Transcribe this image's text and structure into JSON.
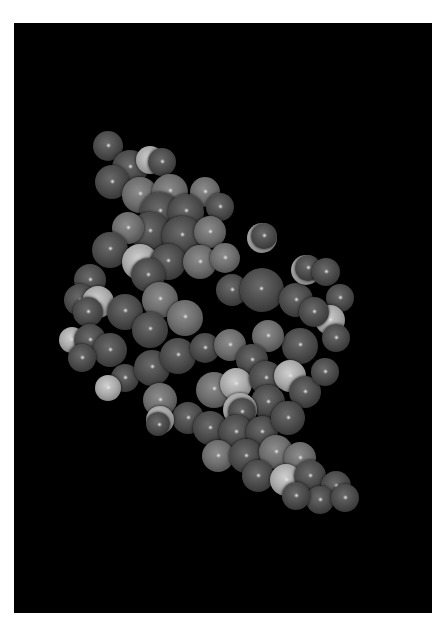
{
  "scene": {
    "subject": "space-filling molecular model",
    "background": "#000000",
    "page_background": "#ffffff",
    "viewport": {
      "x": 14,
      "y": 23,
      "width": 418,
      "height": 590
    }
  },
  "palette": {
    "dark": {
      "base": "#4c4c4c",
      "shade": "#262626",
      "light": "#6a6a6a"
    },
    "mid": {
      "base": "#6e6e6e",
      "shade": "#3a3a3a",
      "light": "#8c8c8c"
    },
    "light": {
      "base": "#aaaaaa",
      "shade": "#6a6a6a",
      "light": "#cfcfcf"
    }
  },
  "atoms": [
    {
      "x": 108,
      "y": 146,
      "r": 15,
      "t": "dark"
    },
    {
      "x": 130,
      "y": 168,
      "r": 18,
      "t": "dark"
    },
    {
      "x": 150,
      "y": 160,
      "r": 14,
      "t": "light"
    },
    {
      "x": 162,
      "y": 162,
      "r": 14,
      "t": "dark"
    },
    {
      "x": 112,
      "y": 182,
      "r": 17,
      "t": "dark"
    },
    {
      "x": 140,
      "y": 195,
      "r": 18,
      "t": "mid"
    },
    {
      "x": 170,
      "y": 192,
      "r": 18,
      "t": "mid"
    },
    {
      "x": 205,
      "y": 192,
      "r": 15,
      "t": "mid"
    },
    {
      "x": 220,
      "y": 207,
      "r": 14,
      "t": "dark"
    },
    {
      "x": 160,
      "y": 212,
      "r": 20,
      "t": "dark"
    },
    {
      "x": 186,
      "y": 212,
      "r": 18,
      "t": "dark"
    },
    {
      "x": 150,
      "y": 232,
      "r": 20,
      "t": "dark"
    },
    {
      "x": 182,
      "y": 236,
      "r": 20,
      "t": "dark"
    },
    {
      "x": 210,
      "y": 232,
      "r": 16,
      "t": "mid"
    },
    {
      "x": 128,
      "y": 228,
      "r": 16,
      "t": "mid"
    },
    {
      "x": 110,
      "y": 250,
      "r": 18,
      "t": "dark"
    },
    {
      "x": 140,
      "y": 262,
      "r": 18,
      "t": "light"
    },
    {
      "x": 168,
      "y": 262,
      "r": 18,
      "t": "dark"
    },
    {
      "x": 148,
      "y": 275,
      "r": 17,
      "t": "dark"
    },
    {
      "x": 200,
      "y": 262,
      "r": 17,
      "t": "mid"
    },
    {
      "x": 225,
      "y": 258,
      "r": 15,
      "t": "mid"
    },
    {
      "x": 90,
      "y": 280,
      "r": 16,
      "t": "dark"
    },
    {
      "x": 80,
      "y": 300,
      "r": 16,
      "t": "dark"
    },
    {
      "x": 98,
      "y": 302,
      "r": 16,
      "t": "light"
    },
    {
      "x": 88,
      "y": 312,
      "r": 15,
      "t": "dark"
    },
    {
      "x": 125,
      "y": 312,
      "r": 18,
      "t": "dark"
    },
    {
      "x": 72,
      "y": 340,
      "r": 13,
      "t": "light"
    },
    {
      "x": 90,
      "y": 340,
      "r": 16,
      "t": "dark"
    },
    {
      "x": 110,
      "y": 350,
      "r": 17,
      "t": "dark"
    },
    {
      "x": 82,
      "y": 358,
      "r": 14,
      "t": "dark"
    },
    {
      "x": 160,
      "y": 300,
      "r": 18,
      "t": "mid"
    },
    {
      "x": 185,
      "y": 318,
      "r": 18,
      "t": "mid"
    },
    {
      "x": 150,
      "y": 330,
      "r": 18,
      "t": "dark"
    },
    {
      "x": 125,
      "y": 378,
      "r": 14,
      "t": "dark"
    },
    {
      "x": 108,
      "y": 388,
      "r": 13,
      "t": "light"
    },
    {
      "x": 152,
      "y": 368,
      "r": 18,
      "t": "dark"
    },
    {
      "x": 178,
      "y": 356,
      "r": 18,
      "t": "dark"
    },
    {
      "x": 205,
      "y": 348,
      "r": 15,
      "t": "dark"
    },
    {
      "x": 230,
      "y": 345,
      "r": 16,
      "t": "mid"
    },
    {
      "x": 262,
      "y": 238,
      "r": 15,
      "t": "light"
    },
    {
      "x": 264,
      "y": 236,
      "r": 13,
      "t": "dark"
    },
    {
      "x": 232,
      "y": 290,
      "r": 16,
      "t": "dark"
    },
    {
      "x": 262,
      "y": 290,
      "r": 22,
      "t": "dark"
    },
    {
      "x": 296,
      "y": 300,
      "r": 17,
      "t": "dark"
    },
    {
      "x": 306,
      "y": 270,
      "r": 15,
      "t": "light"
    },
    {
      "x": 308,
      "y": 268,
      "r": 13,
      "t": "dark"
    },
    {
      "x": 326,
      "y": 272,
      "r": 14,
      "t": "dark"
    },
    {
      "x": 340,
      "y": 298,
      "r": 14,
      "t": "dark"
    },
    {
      "x": 330,
      "y": 320,
      "r": 15,
      "t": "light"
    },
    {
      "x": 314,
      "y": 312,
      "r": 15,
      "t": "dark"
    },
    {
      "x": 336,
      "y": 338,
      "r": 14,
      "t": "dark"
    },
    {
      "x": 300,
      "y": 346,
      "r": 18,
      "t": "dark"
    },
    {
      "x": 268,
      "y": 336,
      "r": 16,
      "t": "mid"
    },
    {
      "x": 252,
      "y": 360,
      "r": 16,
      "t": "dark"
    },
    {
      "x": 214,
      "y": 390,
      "r": 18,
      "t": "mid"
    },
    {
      "x": 236,
      "y": 384,
      "r": 16,
      "t": "light"
    },
    {
      "x": 266,
      "y": 378,
      "r": 17,
      "t": "dark"
    },
    {
      "x": 290,
      "y": 376,
      "r": 16,
      "t": "light"
    },
    {
      "x": 305,
      "y": 392,
      "r": 16,
      "t": "dark"
    },
    {
      "x": 325,
      "y": 372,
      "r": 14,
      "t": "dark"
    },
    {
      "x": 268,
      "y": 402,
      "r": 17,
      "t": "dark"
    },
    {
      "x": 240,
      "y": 410,
      "r": 17,
      "t": "light"
    },
    {
      "x": 242,
      "y": 412,
      "r": 14,
      "t": "dark"
    },
    {
      "x": 160,
      "y": 400,
      "r": 17,
      "t": "mid"
    },
    {
      "x": 188,
      "y": 418,
      "r": 16,
      "t": "dark"
    },
    {
      "x": 160,
      "y": 420,
      "r": 14,
      "t": "light"
    },
    {
      "x": 158,
      "y": 424,
      "r": 12,
      "t": "dark"
    },
    {
      "x": 210,
      "y": 428,
      "r": 17,
      "t": "dark"
    },
    {
      "x": 236,
      "y": 432,
      "r": 17,
      "t": "dark"
    },
    {
      "x": 262,
      "y": 432,
      "r": 16,
      "t": "dark"
    },
    {
      "x": 288,
      "y": 418,
      "r": 17,
      "t": "dark"
    },
    {
      "x": 218,
      "y": 456,
      "r": 16,
      "t": "mid"
    },
    {
      "x": 246,
      "y": 456,
      "r": 17,
      "t": "dark"
    },
    {
      "x": 276,
      "y": 452,
      "r": 17,
      "t": "mid"
    },
    {
      "x": 300,
      "y": 458,
      "r": 16,
      "t": "mid"
    },
    {
      "x": 258,
      "y": 476,
      "r": 16,
      "t": "dark"
    },
    {
      "x": 286,
      "y": 480,
      "r": 16,
      "t": "light"
    },
    {
      "x": 310,
      "y": 476,
      "r": 16,
      "t": "dark"
    },
    {
      "x": 336,
      "y": 486,
      "r": 15,
      "t": "dark"
    },
    {
      "x": 320,
      "y": 500,
      "r": 14,
      "t": "dark"
    },
    {
      "x": 345,
      "y": 498,
      "r": 14,
      "t": "dark"
    },
    {
      "x": 296,
      "y": 496,
      "r": 14,
      "t": "dark"
    }
  ]
}
